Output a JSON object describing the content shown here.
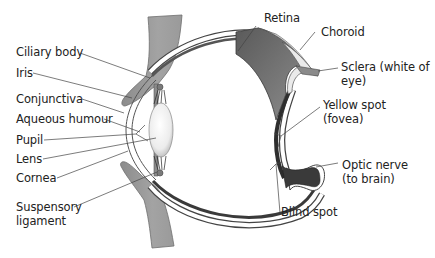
{
  "diagram": {
    "colors": {
      "skin": "#9a9a9a",
      "skin_edge": "#6f6f6f",
      "retina_dark": "#4a4a4a",
      "choroid": "#8a8a8a",
      "sclera": "#ffffff",
      "lens": "#f2f2f2",
      "line": "#333333"
    },
    "labels_left": [
      {
        "id": "ciliary-body",
        "text": "Ciliary body"
      },
      {
        "id": "iris",
        "text": "Iris"
      },
      {
        "id": "conjunctiva",
        "text": "Conjunctiva"
      },
      {
        "id": "aqueous-humour",
        "text": "Aqueous humour"
      },
      {
        "id": "pupil",
        "text": "Pupil"
      },
      {
        "id": "lens",
        "text": "Lens"
      },
      {
        "id": "cornea",
        "text": "Cornea"
      },
      {
        "id": "suspensory-ligament-1",
        "text": "Suspensory"
      },
      {
        "id": "suspensory-ligament-2",
        "text": "ligament"
      }
    ],
    "labels_right": [
      {
        "id": "retina",
        "text": "Retina"
      },
      {
        "id": "choroid",
        "text": "Choroid"
      },
      {
        "id": "sclera-1",
        "text": "Sclera (white of"
      },
      {
        "id": "sclera-2",
        "text": "eye)"
      },
      {
        "id": "yellow-spot-1",
        "text": "Yellow spot"
      },
      {
        "id": "yellow-spot-2",
        "text": "(fovea)"
      },
      {
        "id": "optic-nerve-1",
        "text": "Optic nerve"
      },
      {
        "id": "optic-nerve-2",
        "text": "(to brain)"
      },
      {
        "id": "blind-spot",
        "text": "Blind spot"
      }
    ]
  }
}
